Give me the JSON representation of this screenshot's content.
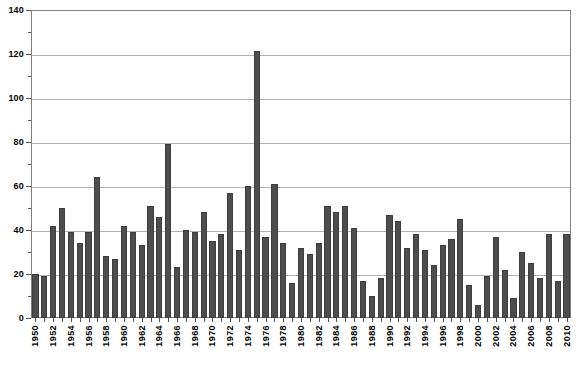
{
  "chart_data": {
    "type": "bar",
    "title": "",
    "subtitle": "",
    "xlabel": "",
    "ylabel": "",
    "ylim": [
      0,
      140
    ],
    "y_major_ticks": [
      0,
      20,
      40,
      60,
      80,
      100,
      120,
      140
    ],
    "y_minor_ticks": [
      10,
      30,
      50,
      70,
      90,
      110,
      130
    ],
    "y_tick_labels": [
      "0",
      "20",
      "40",
      "60",
      "80",
      "100",
      "120",
      "140"
    ],
    "grid": true,
    "grid_axis": "y",
    "legend": false,
    "legend_position": "none",
    "bar_color": "#4d4d4d",
    "categories": [
      "1950",
      "1951",
      "1952",
      "1953",
      "1954",
      "1955",
      "1956",
      "1957",
      "1958",
      "1959",
      "1960",
      "1961",
      "1962",
      "1963",
      "1964",
      "1965",
      "1966",
      "1967",
      "1968",
      "1969",
      "1970",
      "1971",
      "1972",
      "1973",
      "1974",
      "1975",
      "1976",
      "1977",
      "1978",
      "1979",
      "1980",
      "1981",
      "1982",
      "1983",
      "1984",
      "1985",
      "1986",
      "1987",
      "1988",
      "1989",
      "1990",
      "1991",
      "1992",
      "1993",
      "1994",
      "1995",
      "1996",
      "1997",
      "1998",
      "1999",
      "2000",
      "2001",
      "2002",
      "2003",
      "2004",
      "2005",
      "2006",
      "2007",
      "2008",
      "2009",
      "2010"
    ],
    "values": [
      20,
      19,
      42,
      50,
      39,
      34,
      39,
      64,
      28,
      27,
      42,
      39,
      33,
      51,
      46,
      79,
      23,
      40,
      39,
      48,
      35,
      38,
      57,
      31,
      60,
      121.5,
      37,
      61,
      34,
      16,
      32,
      29,
      34,
      51,
      48,
      51,
      41,
      17,
      10,
      18,
      47,
      44,
      32,
      38,
      31,
      24,
      33,
      36,
      45,
      15,
      6,
      19,
      37,
      22,
      9,
      30,
      25,
      18,
      38,
      17,
      38
    ],
    "x_tick_labels": [
      "1950",
      "1952",
      "1954",
      "1956",
      "1958",
      "1960",
      "1962",
      "1964",
      "1966",
      "1968",
      "1970",
      "1972",
      "1974",
      "1976",
      "1978",
      "1980",
      "1982",
      "1984",
      "1986",
      "1988",
      "1990",
      "1992",
      "1994",
      "1996",
      "1998",
      "2000",
      "2002",
      "2004",
      "2006",
      "2008",
      "2010"
    ],
    "x_tick_label_step": 2,
    "x_label_rotation": 90
  }
}
